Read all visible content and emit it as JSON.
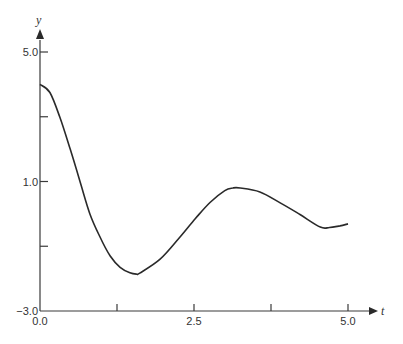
{
  "chart_data": {
    "type": "line",
    "title": "",
    "xlabel": "t",
    "ylabel": "y",
    "xlim": [
      0,
      5
    ],
    "ylim": [
      -3,
      5
    ],
    "grid": false,
    "legend": "none",
    "x_ticks": [
      0,
      1.25,
      2.5,
      3.75,
      5.0
    ],
    "x_tick_labels": [
      "0.0",
      "",
      "2.5",
      "",
      "5.0"
    ],
    "y_ticks": [
      -3,
      -1,
      1,
      3,
      5
    ],
    "y_tick_labels": [
      "−3.0",
      "",
      "1.0",
      "",
      "5.0"
    ],
    "series": [
      {
        "name": "y(t)",
        "x": [
          0.0,
          0.16,
          0.32,
          0.49,
          0.65,
          0.81,
          0.97,
          1.14,
          1.3,
          1.46,
          1.57,
          1.62,
          1.95,
          2.27,
          2.52,
          2.76,
          3.0,
          3.13,
          3.25,
          3.57,
          3.9,
          4.22,
          4.55,
          4.7,
          4.87,
          5.0
        ],
        "y": [
          4.0,
          3.75,
          3.0,
          2.0,
          1.0,
          0.0,
          -0.7,
          -1.3,
          -1.65,
          -1.82,
          -1.86,
          -1.83,
          -1.4,
          -0.72,
          -0.15,
          0.35,
          0.72,
          0.8,
          0.8,
          0.68,
          0.34,
          -0.02,
          -0.41,
          -0.42,
          -0.37,
          -0.31
        ]
      }
    ]
  }
}
